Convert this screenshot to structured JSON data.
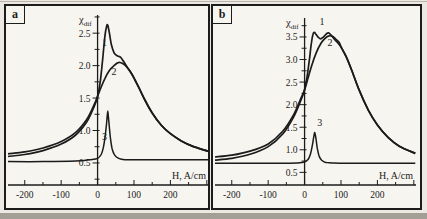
{
  "figure_title": "",
  "chart_data": [
    {
      "type": "line",
      "panel_label": "a",
      "ylabel": "χ_dif",
      "ylabel_symbol": "χ",
      "ylabel_subscript": "dif",
      "xlabel": "H, A/cm",
      "xlim": [
        -246,
        306
      ],
      "ylim": [
        0.16,
        2.78
      ],
      "x_ticks": [
        {
          "v": -200,
          "label": "-200"
        },
        {
          "v": -100,
          "label": "-100"
        },
        {
          "v": 0,
          "label": "0"
        },
        {
          "v": 100,
          "label": "100"
        },
        {
          "v": 200,
          "label": "200"
        },
        {
          "v": 300,
          "label": ""
        }
      ],
      "x_minor_ticks": [
        -150,
        -50,
        50,
        150,
        250
      ],
      "y_ticks": [
        {
          "v": 0.5,
          "label": "0.5"
        },
        {
          "v": 1.0,
          "label": "1.0"
        },
        {
          "v": 1.5,
          "label": "1.5"
        },
        {
          "v": 2.0,
          "label": "2.0"
        },
        {
          "v": 2.5,
          "label": "2.5"
        }
      ],
      "y_minor_ticks": [
        0.25,
        0.75,
        1.25,
        1.75,
        2.25,
        2.75
      ],
      "series": [
        {
          "name": "1",
          "label_pos": [
            19,
            2.3
          ],
          "points": [
            [
              -246,
              0.6
            ],
            [
              -200,
              0.63
            ],
            [
              -150,
              0.69
            ],
            [
              -100,
              0.79
            ],
            [
              -60,
              0.93
            ],
            [
              -30,
              1.13
            ],
            [
              -10,
              1.36
            ],
            [
              0,
              1.52
            ],
            [
              8,
              1.78
            ],
            [
              14,
              2.1
            ],
            [
              20,
              2.45
            ],
            [
              25,
              2.61
            ],
            [
              28,
              2.62
            ],
            [
              32,
              2.52
            ],
            [
              38,
              2.32
            ],
            [
              46,
              2.19
            ],
            [
              55,
              2.15
            ],
            [
              63,
              2.13
            ],
            [
              72,
              2.06
            ],
            [
              82,
              1.97
            ],
            [
              95,
              1.86
            ],
            [
              110,
              1.7
            ],
            [
              130,
              1.47
            ],
            [
              150,
              1.27
            ],
            [
              175,
              1.08
            ],
            [
              200,
              0.95
            ],
            [
              230,
              0.84
            ],
            [
              260,
              0.76
            ],
            [
              304,
              0.68
            ]
          ]
        },
        {
          "name": "2",
          "label_pos": [
            45,
            1.86
          ],
          "points": [
            [
              -246,
              0.64
            ],
            [
              -200,
              0.67
            ],
            [
              -150,
              0.73
            ],
            [
              -100,
              0.83
            ],
            [
              -60,
              0.97
            ],
            [
              -30,
              1.17
            ],
            [
              -10,
              1.39
            ],
            [
              0,
              1.53
            ],
            [
              10,
              1.67
            ],
            [
              20,
              1.8
            ],
            [
              32,
              1.92
            ],
            [
              45,
              2.0
            ],
            [
              58,
              2.05
            ],
            [
              70,
              2.03
            ],
            [
              82,
              1.97
            ],
            [
              95,
              1.86
            ],
            [
              110,
              1.7
            ],
            [
              130,
              1.47
            ],
            [
              150,
              1.27
            ],
            [
              175,
              1.08
            ],
            [
              200,
              0.95
            ],
            [
              230,
              0.84
            ],
            [
              260,
              0.76
            ],
            [
              304,
              0.68
            ]
          ]
        },
        {
          "name": "3",
          "label_pos": [
            19,
            0.85
          ],
          "points": [
            [
              -246,
              0.52
            ],
            [
              -150,
              0.52
            ],
            [
              -60,
              0.53
            ],
            [
              -20,
              0.55
            ],
            [
              0,
              0.57
            ],
            [
              10,
              0.63
            ],
            [
              16,
              0.74
            ],
            [
              21,
              0.92
            ],
            [
              25,
              1.13
            ],
            [
              28,
              1.3
            ],
            [
              31,
              1.13
            ],
            [
              35,
              0.9
            ],
            [
              40,
              0.72
            ],
            [
              47,
              0.62
            ],
            [
              58,
              0.57
            ],
            [
              75,
              0.55
            ],
            [
              110,
              0.55
            ],
            [
              200,
              0.55
            ],
            [
              304,
              0.55
            ]
          ]
        }
      ]
    },
    {
      "type": "line",
      "panel_label": "b",
      "ylabel": "χ_dif",
      "ylabel_symbol": "χ",
      "ylabel_subscript": "dif",
      "xlabel": "H, A/cm",
      "xlim": [
        -246,
        306
      ],
      "ylim": [
        0.22,
        3.92
      ],
      "x_ticks": [
        {
          "v": -200,
          "label": "-200"
        },
        {
          "v": -100,
          "label": "-100"
        },
        {
          "v": 0,
          "label": "0"
        },
        {
          "v": 100,
          "label": "100"
        },
        {
          "v": 200,
          "label": "200"
        },
        {
          "v": 300,
          "label": ""
        }
      ],
      "x_minor_ticks": [
        -150,
        -50,
        50,
        150,
        250
      ],
      "y_ticks": [
        {
          "v": 0.5,
          "label": "0.5"
        },
        {
          "v": 1.0,
          "label": "1.0"
        },
        {
          "v": 1.5,
          "label": "1.5"
        },
        {
          "v": 2.0,
          "label": "2.0"
        },
        {
          "v": 2.5,
          "label": "2.5"
        },
        {
          "v": 3.0,
          "label": "3.0"
        },
        {
          "v": 3.5,
          "label": "3.5"
        }
      ],
      "y_minor_ticks": [
        0.75,
        1.25,
        1.75,
        2.25,
        2.75,
        3.25,
        3.75
      ],
      "series": [
        {
          "name": "1",
          "label_pos": [
            48,
            3.76
          ],
          "points": [
            [
              -246,
              0.77
            ],
            [
              -200,
              0.81
            ],
            [
              -150,
              0.9
            ],
            [
              -100,
              1.07
            ],
            [
              -60,
              1.35
            ],
            [
              -30,
              1.73
            ],
            [
              -10,
              2.1
            ],
            [
              0,
              2.33
            ],
            [
              8,
              2.68
            ],
            [
              14,
              3.05
            ],
            [
              19,
              3.38
            ],
            [
              23,
              3.56
            ],
            [
              27,
              3.6
            ],
            [
              31,
              3.56
            ],
            [
              37,
              3.5
            ],
            [
              44,
              3.46
            ],
            [
              52,
              3.5
            ],
            [
              60,
              3.57
            ],
            [
              66,
              3.59
            ],
            [
              73,
              3.54
            ],
            [
              82,
              3.45
            ],
            [
              92,
              3.36
            ],
            [
              102,
              3.25
            ],
            [
              115,
              3.05
            ],
            [
              130,
              2.75
            ],
            [
              150,
              2.32
            ],
            [
              175,
              1.88
            ],
            [
              200,
              1.55
            ],
            [
              230,
              1.27
            ],
            [
              260,
              1.08
            ],
            [
              304,
              0.92
            ]
          ]
        },
        {
          "name": "2",
          "label_pos": [
            70,
            3.3
          ],
          "points": [
            [
              -246,
              0.84
            ],
            [
              -200,
              0.88
            ],
            [
              -150,
              0.97
            ],
            [
              -100,
              1.13
            ],
            [
              -60,
              1.41
            ],
            [
              -30,
              1.78
            ],
            [
              -10,
              2.14
            ],
            [
              0,
              2.33
            ],
            [
              10,
              2.6
            ],
            [
              20,
              2.88
            ],
            [
              32,
              3.15
            ],
            [
              45,
              3.36
            ],
            [
              55,
              3.46
            ],
            [
              65,
              3.52
            ],
            [
              75,
              3.52
            ],
            [
              85,
              3.46
            ],
            [
              95,
              3.38
            ],
            [
              102,
              3.25
            ],
            [
              115,
              3.05
            ],
            [
              130,
              2.75
            ],
            [
              150,
              2.32
            ],
            [
              175,
              1.88
            ],
            [
              200,
              1.55
            ],
            [
              230,
              1.27
            ],
            [
              260,
              1.08
            ],
            [
              304,
              0.92
            ]
          ]
        },
        {
          "name": "3",
          "label_pos": [
            42,
            1.52
          ],
          "points": [
            [
              -246,
              0.7
            ],
            [
              -150,
              0.7
            ],
            [
              -60,
              0.7
            ],
            [
              -20,
              0.71
            ],
            [
              0,
              0.73
            ],
            [
              10,
              0.79
            ],
            [
              16,
              0.9
            ],
            [
              21,
              1.08
            ],
            [
              25,
              1.28
            ],
            [
              28,
              1.38
            ],
            [
              31,
              1.26
            ],
            [
              35,
              1.03
            ],
            [
              40,
              0.86
            ],
            [
              47,
              0.77
            ],
            [
              58,
              0.72
            ],
            [
              75,
              0.71
            ],
            [
              110,
              0.7
            ],
            [
              200,
              0.7
            ],
            [
              304,
              0.7
            ]
          ]
        }
      ]
    }
  ],
  "style": {
    "ink_color": "#1b1b1b",
    "panel_bg": "#f7f5ef"
  }
}
